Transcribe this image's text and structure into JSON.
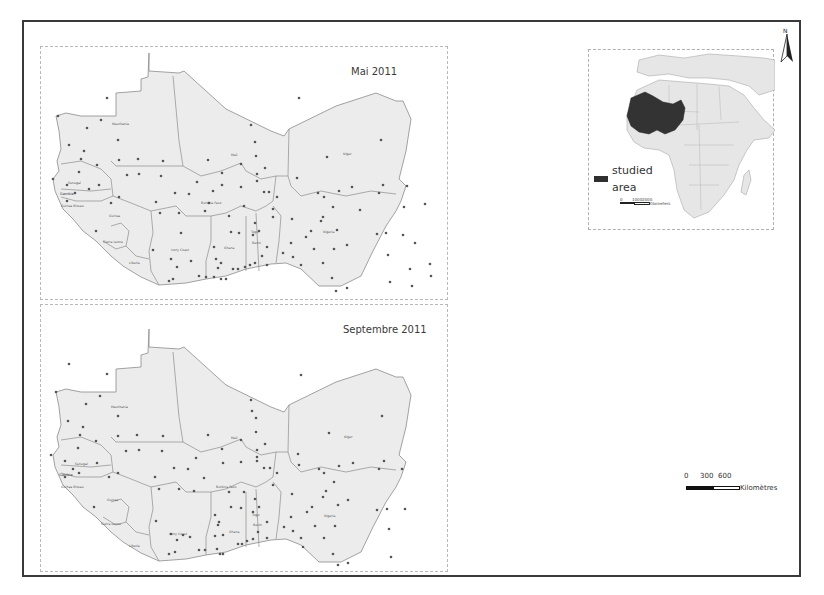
{
  "figure": {
    "panels": [
      {
        "id": "may",
        "title": "Mai 2011"
      },
      {
        "id": "september",
        "title": "Septembre 2011"
      }
    ],
    "country_labels": [
      "Mauritania",
      "Mali",
      "Niger",
      "Senegal",
      "Gambia",
      "Guinea Bissau",
      "Guinea",
      "Sierra Leone",
      "Liberia",
      "Ivory Coast",
      "Burkina Faso",
      "Ghana",
      "Togo",
      "Benin",
      "Nigeria"
    ],
    "inset": {
      "legend_label_line1": "studied",
      "legend_label_line2": "area",
      "scale_ticks": [
        "0",
        "1000",
        "2000"
      ],
      "scale_unit": "Kilometers",
      "highlight_color": "#333333"
    },
    "north_arrow": {
      "label": "N"
    },
    "scale_bar": {
      "ticks": [
        "0",
        "300",
        "600"
      ],
      "unit": "Kilomètres"
    },
    "colors": {
      "land": "#ececec",
      "border": "#8c8c8c",
      "station_dot": "#555555",
      "frame": "#3a3a3a",
      "studied_area": "#333333"
    }
  }
}
